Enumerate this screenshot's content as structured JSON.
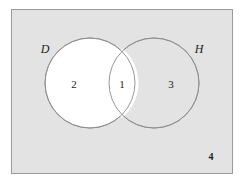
{
  "figure": {
    "type": "venn-diagram",
    "sets": 2,
    "universe": {
      "name": "universal-set-rectangle",
      "fill_color": "#e3e3e3",
      "stroke_color": "#9a9a9a"
    },
    "circle_fill_color": "#ffffff",
    "circle_stroke_color": "#8c8c8c",
    "text_color": "#1d1d1d",
    "set_labels": [
      {
        "id": "D",
        "text": "D",
        "position": "outside-upper-left"
      },
      {
        "id": "H",
        "text": "H",
        "position": "outside-upper-right"
      }
    ],
    "regions": [
      {
        "id": "D-only",
        "label": "2",
        "description": "D only"
      },
      {
        "id": "D-and-H",
        "label": "1",
        "description": "intersection of D and H"
      },
      {
        "id": "H-only",
        "label": "3",
        "description": "H only"
      },
      {
        "id": "outside",
        "label": "4",
        "description": "outside both sets"
      }
    ]
  }
}
